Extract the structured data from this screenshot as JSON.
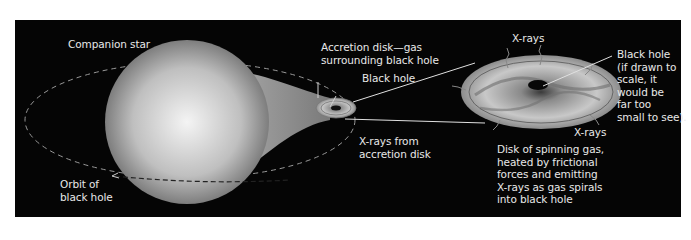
{
  "diagram": {
    "colors": {
      "background": "#050505",
      "frame": "#ffffff",
      "text": "#e8e8e8",
      "star": "#d9d9d9",
      "disk": "#bdbdbd"
    },
    "labels": {
      "companion_star": "Companion star",
      "orbit": "Orbit of\nblack hole",
      "accretion_disk": "Accretion disk—gas\nsurrounding black hole",
      "black_hole_small": "Black hole",
      "xrays_from_disk": "X-rays from\naccretion disk",
      "xrays_top": "X-rays",
      "xrays_right": "X-rays",
      "black_hole_large": "Black hole\n(if drawn to\nscale, it\nwould be\nfar too\nsmall to see).",
      "spinning_disk": "Disk of spinning gas,\nheated by frictional\nforces and emitting\nX-rays as gas spirals\ninto black hole"
    }
  }
}
